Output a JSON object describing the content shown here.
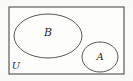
{
  "figure": {
    "type": "venn-diagram",
    "title": "",
    "width": 133,
    "height": 81,
    "background_color": "#fbfbfa",
    "stroke_color": "#565656",
    "universe": {
      "label": "U",
      "shape": "rectangle",
      "x": 9,
      "y": 7,
      "width": 115,
      "height": 67,
      "label_x": 16,
      "label_y": 66
    },
    "sets": [
      {
        "name": "set-b",
        "label": "B",
        "shape": "ellipse",
        "cx": 48,
        "cy": 36,
        "rx": 34,
        "ry": 22,
        "label_x": 48,
        "label_y": 33
      },
      {
        "name": "set-a",
        "label": "A",
        "shape": "ellipse",
        "cx": 100,
        "cy": 57,
        "rx": 18,
        "ry": 15,
        "label_x": 100,
        "label_y": 57
      }
    ],
    "relationship": "disjoint"
  }
}
